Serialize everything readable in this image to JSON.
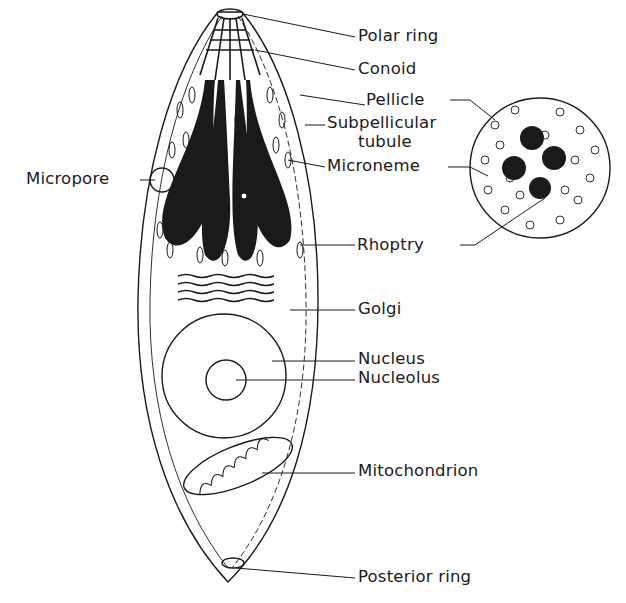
{
  "diagram": {
    "labels": {
      "polar_ring": "Polar ring",
      "conoid": "Conoid",
      "pellicle": "Pellicle",
      "subpellicular_tubule_line1": "Subpellicular",
      "subpellicular_tubule_line2": "tubule",
      "microneme": "Microneme",
      "micropore": "Micropore",
      "rhoptry": "Rhoptry",
      "golgi": "Golgi",
      "nucleus": "Nucleus",
      "nucleolus": "Nucleolus",
      "mitochondrion": "Mitochondrion",
      "posterior_ring": "Posterior ring"
    },
    "colors": {
      "ink": "#1a1a1a",
      "background": "#ffffff"
    }
  }
}
